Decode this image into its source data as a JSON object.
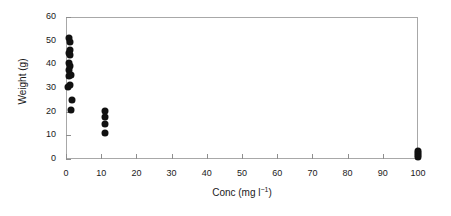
{
  "chart_data": {
    "type": "scatter",
    "title": "",
    "xlabel": "Conc (mg l−1)",
    "xlabel_base": "Conc (mg l",
    "xlabel_sup": "−1",
    "xlabel_tail": ")",
    "ylabel": "Weight (g)",
    "xlim": [
      0,
      100
    ],
    "ylim": [
      0,
      60
    ],
    "xticks": [
      0,
      10,
      20,
      30,
      40,
      50,
      60,
      70,
      80,
      90,
      100
    ],
    "yticks": [
      0,
      10,
      20,
      30,
      40,
      50,
      60
    ],
    "xticklabels": [
      "0",
      "10",
      "20",
      "30",
      "40",
      "50",
      "60",
      "70",
      "80",
      "90",
      "100"
    ],
    "yticklabels": [
      "0",
      "10",
      "20",
      "30",
      "40",
      "50",
      "60"
    ],
    "grid": false,
    "legend": false,
    "marker": "filled-circle",
    "marker_color": "#111111",
    "frame_color": "#a8a8a8",
    "points": [
      {
        "x": 0.9,
        "y": 51.0
      },
      {
        "x": 1.0,
        "y": 49.3
      },
      {
        "x": 1.0,
        "y": 46.2
      },
      {
        "x": 0.9,
        "y": 45.0
      },
      {
        "x": 1.0,
        "y": 43.8
      },
      {
        "x": 0.9,
        "y": 40.5
      },
      {
        "x": 1.0,
        "y": 39.2
      },
      {
        "x": 0.9,
        "y": 37.8
      },
      {
        "x": 1.3,
        "y": 35.5
      },
      {
        "x": 0.8,
        "y": 35.0
      },
      {
        "x": 1.1,
        "y": 31.2
      },
      {
        "x": 0.6,
        "y": 30.6
      },
      {
        "x": 1.6,
        "y": 25.0
      },
      {
        "x": 1.4,
        "y": 20.8
      },
      {
        "x": 11.0,
        "y": 20.4
      },
      {
        "x": 11.0,
        "y": 17.6
      },
      {
        "x": 11.0,
        "y": 14.8
      },
      {
        "x": 11.0,
        "y": 10.8
      },
      {
        "x": 100.0,
        "y": 3.2
      },
      {
        "x": 100.0,
        "y": 2.4
      },
      {
        "x": 100.0,
        "y": 1.6
      },
      {
        "x": 100.0,
        "y": 0.9
      }
    ]
  }
}
